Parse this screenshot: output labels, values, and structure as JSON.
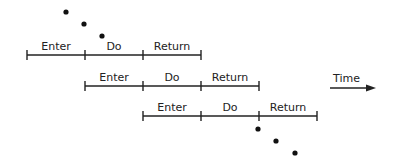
{
  "diagram": {
    "phases": [
      "Enter",
      "Do",
      "Return"
    ],
    "rows": [
      {
        "name": "row-1",
        "phases": [
          "Enter",
          "Do",
          "Return"
        ],
        "start_slot": 0
      },
      {
        "name": "row-2",
        "phases": [
          "Enter",
          "Do",
          "Return"
        ],
        "start_slot": 1
      },
      {
        "name": "row-3",
        "phases": [
          "Enter",
          "Do",
          "Return"
        ],
        "start_slot": 2
      }
    ],
    "continuation_before": "…",
    "continuation_after": "…",
    "time_axis": {
      "label": "Time",
      "direction": "right"
    },
    "colors": {
      "ink": "#222222",
      "background": "#ffffff"
    }
  }
}
